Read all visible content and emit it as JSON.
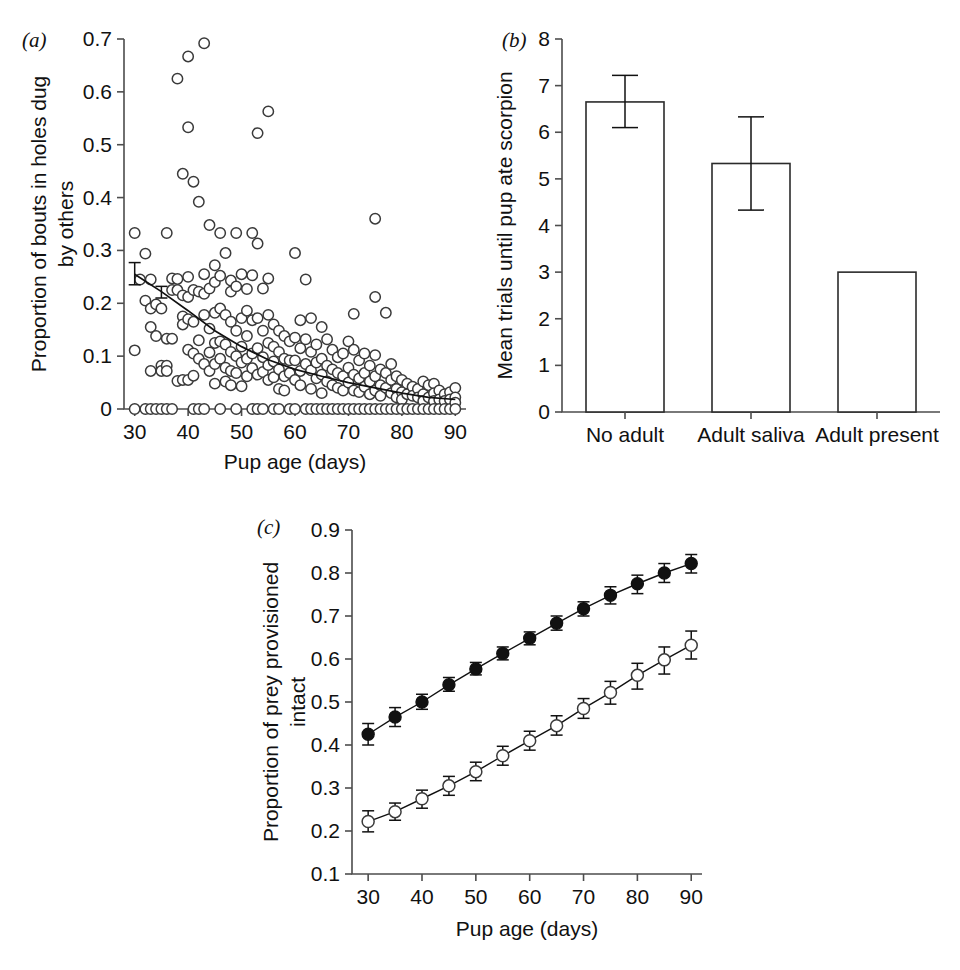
{
  "figure": {
    "background": "#ffffff",
    "axis_color": "#4d4d4d",
    "marker_color": "#111111"
  },
  "panels": {
    "a": {
      "letter": "(a)",
      "xlabel": "Pup age (days)",
      "ylabel_line1": "Proportion of bouts in holes dug",
      "ylabel_line2": "by others",
      "xticks": [
        "30",
        "40",
        "50",
        "60",
        "70",
        "80",
        "90"
      ],
      "yticks": [
        "0",
        "0.1",
        "0.2",
        "0.3",
        "0.4",
        "0.5",
        "0.6",
        "0.7"
      ]
    },
    "b": {
      "letter": "(b)",
      "ylabel": "Mean trials until pup ate scorpion",
      "xticks": [
        "No adult",
        "Adult saliva",
        "Adult present"
      ],
      "yticks": [
        "0",
        "1",
        "2",
        "3",
        "4",
        "5",
        "6",
        "7",
        "8"
      ]
    },
    "c": {
      "letter": "(c)",
      "xlabel": "Pup age (days)",
      "ylabel_line1": "Proportion of prey provisioned",
      "ylabel_line2": "intact",
      "xticks": [
        "30",
        "40",
        "50",
        "60",
        "70",
        "80",
        "90"
      ],
      "yticks": [
        "0.1",
        "0.2",
        "0.3",
        "0.4",
        "0.5",
        "0.6",
        "0.7",
        "0.8",
        "0.9"
      ]
    }
  },
  "chart_data": [
    {
      "id": "panel-a",
      "type": "scatter",
      "title": "",
      "xlabel": "Pup age (days)",
      "ylabel": "Proportion of bouts in holes dug by others",
      "xlim": [
        28,
        92
      ],
      "ylim": [
        0,
        0.7
      ],
      "xticks": [
        30,
        40,
        50,
        60,
        70,
        80,
        90
      ],
      "yticks": [
        0,
        0.1,
        0.2,
        0.3,
        0.4,
        0.5,
        0.6,
        0.7
      ],
      "grid": false,
      "legend": "none",
      "marker": "open-circle",
      "points": [
        [
          30,
          0.333
        ],
        [
          30,
          0.111
        ],
        [
          30,
          0.0
        ],
        [
          31,
          0.245
        ],
        [
          32,
          0.294
        ],
        [
          32,
          0.205
        ],
        [
          32,
          0.0
        ],
        [
          33,
          0.245
        ],
        [
          33,
          0.19
        ],
        [
          33,
          0.155
        ],
        [
          33,
          0.072
        ],
        [
          33,
          0.0
        ],
        [
          34,
          0.198
        ],
        [
          34,
          0.138
        ],
        [
          34,
          0.0
        ],
        [
          35,
          0.19
        ],
        [
          35,
          0.082
        ],
        [
          35,
          0.072
        ],
        [
          35,
          0.0
        ],
        [
          36,
          0.333
        ],
        [
          36,
          0.133
        ],
        [
          36,
          0.082
        ],
        [
          36,
          0.072
        ],
        [
          36,
          0.0
        ],
        [
          37,
          0.247
        ],
        [
          37,
          0.225
        ],
        [
          37,
          0.133
        ],
        [
          37,
          0.0
        ],
        [
          38,
          0.625
        ],
        [
          38,
          0.246
        ],
        [
          38,
          0.225
        ],
        [
          38,
          0.053
        ],
        [
          39,
          0.445
        ],
        [
          39,
          0.215
        ],
        [
          39,
          0.175
        ],
        [
          39,
          0.16
        ],
        [
          39,
          0.055
        ],
        [
          40,
          0.667
        ],
        [
          40,
          0.533
        ],
        [
          40,
          0.25
        ],
        [
          40,
          0.212
        ],
        [
          40,
          0.17
        ],
        [
          40,
          0.112
        ],
        [
          40,
          0.055
        ],
        [
          41,
          0.43
        ],
        [
          41,
          0.225
        ],
        [
          41,
          0.165
        ],
        [
          41,
          0.105
        ],
        [
          41,
          0.063
        ],
        [
          41,
          0.0
        ],
        [
          42,
          0.392
        ],
        [
          42,
          0.222
        ],
        [
          42,
          0.13
        ],
        [
          42,
          0.095
        ],
        [
          42,
          0.0
        ],
        [
          43,
          0.692
        ],
        [
          43,
          0.255
        ],
        [
          43,
          0.218
        ],
        [
          43,
          0.178
        ],
        [
          43,
          0.085
        ],
        [
          43,
          0.0
        ],
        [
          44,
          0.348
        ],
        [
          44,
          0.228
        ],
        [
          44,
          0.152
        ],
        [
          44,
          0.107
        ],
        [
          44,
          0.072
        ],
        [
          45,
          0.272
        ],
        [
          45,
          0.24
        ],
        [
          45,
          0.182
        ],
        [
          45,
          0.125
        ],
        [
          45,
          0.085
        ],
        [
          45,
          0.048
        ],
        [
          46,
          0.333
        ],
        [
          46,
          0.252
        ],
        [
          46,
          0.19
        ],
        [
          46,
          0.128
        ],
        [
          46,
          0.095
        ],
        [
          46,
          0.0
        ],
        [
          47,
          0.295
        ],
        [
          47,
          0.178
        ],
        [
          47,
          0.122
        ],
        [
          47,
          0.078
        ],
        [
          47,
          0.052
        ],
        [
          48,
          0.243
        ],
        [
          48,
          0.222
        ],
        [
          48,
          0.165
        ],
        [
          48,
          0.108
        ],
        [
          48,
          0.072
        ],
        [
          48,
          0.045
        ],
        [
          49,
          0.333
        ],
        [
          49,
          0.232
        ],
        [
          49,
          0.148
        ],
        [
          49,
          0.1
        ],
        [
          49,
          0.068
        ],
        [
          49,
          0.0
        ],
        [
          50,
          0.255
        ],
        [
          50,
          0.172
        ],
        [
          50,
          0.118
        ],
        [
          50,
          0.088
        ],
        [
          50,
          0.043
        ],
        [
          51,
          0.227
        ],
        [
          51,
          0.186
        ],
        [
          51,
          0.138
        ],
        [
          51,
          0.095
        ],
        [
          51,
          0.062
        ],
        [
          52,
          0.333
        ],
        [
          52,
          0.253
        ],
        [
          52,
          0.168
        ],
        [
          52,
          0.105
        ],
        [
          52,
          0.077
        ],
        [
          52,
          0.0
        ],
        [
          53,
          0.522
        ],
        [
          53,
          0.313
        ],
        [
          53,
          0.172
        ],
        [
          53,
          0.115
        ],
        [
          53,
          0.065
        ],
        [
          53,
          0.0
        ],
        [
          54,
          0.228
        ],
        [
          54,
          0.148
        ],
        [
          54,
          0.098
        ],
        [
          54,
          0.07
        ],
        [
          54,
          0.0
        ],
        [
          55,
          0.563
        ],
        [
          55,
          0.247
        ],
        [
          55,
          0.178
        ],
        [
          55,
          0.125
        ],
        [
          55,
          0.083
        ],
        [
          55,
          0.055
        ],
        [
          56,
          0.16
        ],
        [
          56,
          0.118
        ],
        [
          56,
          0.09
        ],
        [
          56,
          0.06
        ],
        [
          56,
          0.0
        ],
        [
          57,
          0.148
        ],
        [
          57,
          0.108
        ],
        [
          57,
          0.075
        ],
        [
          57,
          0.038
        ],
        [
          57,
          0.0
        ],
        [
          58,
          0.138
        ],
        [
          58,
          0.095
        ],
        [
          58,
          0.062
        ],
        [
          58,
          0.035
        ],
        [
          59,
          0.128
        ],
        [
          59,
          0.092
        ],
        [
          59,
          0.068
        ],
        [
          59,
          0.0
        ],
        [
          60,
          0.295
        ],
        [
          60,
          0.135
        ],
        [
          60,
          0.092
        ],
        [
          60,
          0.055
        ],
        [
          60,
          0.0
        ],
        [
          61,
          0.168
        ],
        [
          61,
          0.115
        ],
        [
          61,
          0.072
        ],
        [
          61,
          0.045
        ],
        [
          62,
          0.245
        ],
        [
          62,
          0.132
        ],
        [
          62,
          0.085
        ],
        [
          62,
          0.0
        ],
        [
          63,
          0.172
        ],
        [
          63,
          0.108
        ],
        [
          63,
          0.073
        ],
        [
          63,
          0.038
        ],
        [
          63,
          0.0
        ],
        [
          64,
          0.122
        ],
        [
          64,
          0.088
        ],
        [
          64,
          0.058
        ],
        [
          64,
          0.0
        ],
        [
          65,
          0.155
        ],
        [
          65,
          0.095
        ],
        [
          65,
          0.065
        ],
        [
          65,
          0.03
        ],
        [
          65,
          0.0
        ],
        [
          66,
          0.132
        ],
        [
          66,
          0.082
        ],
        [
          66,
          0.052
        ],
        [
          66,
          0.0
        ],
        [
          67,
          0.112
        ],
        [
          67,
          0.075
        ],
        [
          67,
          0.045
        ],
        [
          67,
          0.0
        ],
        [
          68,
          0.098
        ],
        [
          68,
          0.068
        ],
        [
          68,
          0.04
        ],
        [
          68,
          0.0
        ],
        [
          69,
          0.105
        ],
        [
          69,
          0.062
        ],
        [
          69,
          0.035
        ],
        [
          69,
          0.0
        ],
        [
          70,
          0.128
        ],
        [
          70,
          0.078
        ],
        [
          70,
          0.05
        ],
        [
          70,
          0.0
        ],
        [
          71,
          0.18
        ],
        [
          71,
          0.112
        ],
        [
          71,
          0.065
        ],
        [
          71,
          0.035
        ],
        [
          71,
          0.0
        ],
        [
          72,
          0.092
        ],
        [
          72,
          0.058
        ],
        [
          72,
          0.032
        ],
        [
          72,
          0.0
        ],
        [
          73,
          0.105
        ],
        [
          73,
          0.068
        ],
        [
          73,
          0.042
        ],
        [
          73,
          0.0
        ],
        [
          74,
          0.082
        ],
        [
          74,
          0.052
        ],
        [
          74,
          0.028
        ],
        [
          74,
          0.0
        ],
        [
          75,
          0.36
        ],
        [
          75,
          0.212
        ],
        [
          75,
          0.102
        ],
        [
          75,
          0.062
        ],
        [
          75,
          0.035
        ],
        [
          75,
          0.0
        ],
        [
          76,
          0.075
        ],
        [
          76,
          0.045
        ],
        [
          76,
          0.025
        ],
        [
          76,
          0.0
        ],
        [
          77,
          0.182
        ],
        [
          77,
          0.068
        ],
        [
          77,
          0.04
        ],
        [
          77,
          0.0
        ],
        [
          78,
          0.085
        ],
        [
          78,
          0.055
        ],
        [
          78,
          0.03
        ],
        [
          78,
          0.0
        ],
        [
          79,
          0.062
        ],
        [
          79,
          0.038
        ],
        [
          79,
          0.022
        ],
        [
          79,
          0.0
        ],
        [
          80,
          0.055
        ],
        [
          80,
          0.032
        ],
        [
          80,
          0.018
        ],
        [
          80,
          0.0
        ],
        [
          81,
          0.048
        ],
        [
          81,
          0.028
        ],
        [
          81,
          0.0
        ],
        [
          82,
          0.042
        ],
        [
          82,
          0.025
        ],
        [
          82,
          0.0
        ],
        [
          83,
          0.038
        ],
        [
          83,
          0.022
        ],
        [
          83,
          0.0
        ],
        [
          84,
          0.052
        ],
        [
          84,
          0.028
        ],
        [
          84,
          0.015
        ],
        [
          84,
          0.0
        ],
        [
          85,
          0.045
        ],
        [
          85,
          0.022
        ],
        [
          85,
          0.0
        ],
        [
          86,
          0.048
        ],
        [
          86,
          0.03
        ],
        [
          86,
          0.015
        ],
        [
          86,
          0.0
        ],
        [
          87,
          0.035
        ],
        [
          87,
          0.018
        ],
        [
          87,
          0.0
        ],
        [
          88,
          0.028
        ],
        [
          88,
          0.015
        ],
        [
          88,
          0.0
        ],
        [
          89,
          0.032
        ],
        [
          89,
          0.018
        ],
        [
          89,
          0.0
        ],
        [
          90,
          0.04
        ],
        [
          90,
          0.022
        ],
        [
          90,
          0.012
        ],
        [
          90,
          0.0
        ]
      ],
      "fit_line": [
        [
          30,
          0.255
        ],
        [
          35,
          0.222
        ],
        [
          40,
          0.186
        ],
        [
          45,
          0.148
        ],
        [
          50,
          0.118
        ],
        [
          55,
          0.093
        ],
        [
          60,
          0.075
        ],
        [
          65,
          0.062
        ],
        [
          70,
          0.05
        ],
        [
          75,
          0.04
        ],
        [
          80,
          0.03
        ],
        [
          85,
          0.022
        ],
        [
          90,
          0.018
        ]
      ],
      "fit_errorbars": [
        {
          "x": 30,
          "y": 0.255,
          "low": 0.235,
          "high": 0.277
        },
        {
          "x": 35,
          "y": 0.222,
          "low": 0.21,
          "high": 0.232
        }
      ]
    },
    {
      "id": "panel-b",
      "type": "bar",
      "title": "",
      "xlabel": "",
      "ylabel": "Mean trials until pup ate scorpion",
      "categories": [
        "No adult",
        "Adult saliva",
        "Adult present"
      ],
      "values": [
        6.65,
        5.33,
        3.0
      ],
      "errors_low": [
        6.1,
        4.33,
        null
      ],
      "errors_high": [
        7.22,
        6.33,
        null
      ],
      "ylim": [
        0,
        8
      ],
      "yticks": [
        0,
        1,
        2,
        3,
        4,
        5,
        6,
        7,
        8
      ],
      "grid": false,
      "legend": "none"
    },
    {
      "id": "panel-c",
      "type": "line",
      "title": "",
      "xlabel": "Pup age (days)",
      "ylabel": "Proportion of prey provisioned intact",
      "x": [
        30,
        35,
        40,
        45,
        50,
        55,
        60,
        65,
        70,
        75,
        80,
        85,
        90
      ],
      "xlim": [
        27,
        92
      ],
      "ylim": [
        0.1,
        0.9
      ],
      "xticks": [
        30,
        40,
        50,
        60,
        70,
        80,
        90
      ],
      "yticks": [
        0.1,
        0.2,
        0.3,
        0.4,
        0.5,
        0.6,
        0.7,
        0.8,
        0.9
      ],
      "grid": false,
      "legend": "none",
      "series": [
        {
          "name": "filled-circles",
          "marker": "filled-circle",
          "values": [
            0.425,
            0.465,
            0.5,
            0.54,
            0.577,
            0.613,
            0.648,
            0.683,
            0.717,
            0.748,
            0.775,
            0.8,
            0.822
          ],
          "err_low": [
            0.4,
            0.443,
            0.483,
            0.525,
            0.563,
            0.598,
            0.633,
            0.667,
            0.7,
            0.728,
            0.752,
            0.778,
            0.8
          ],
          "err_high": [
            0.45,
            0.487,
            0.518,
            0.557,
            0.592,
            0.628,
            0.663,
            0.7,
            0.733,
            0.768,
            0.795,
            0.822,
            0.843
          ]
        },
        {
          "name": "open-circles",
          "marker": "open-circle",
          "values": [
            0.222,
            0.245,
            0.275,
            0.305,
            0.338,
            0.375,
            0.41,
            0.445,
            0.485,
            0.522,
            0.562,
            0.598,
            0.632
          ],
          "err_low": [
            0.198,
            0.225,
            0.253,
            0.283,
            0.317,
            0.353,
            0.388,
            0.423,
            0.462,
            0.495,
            0.53,
            0.565,
            0.6
          ],
          "err_high": [
            0.247,
            0.265,
            0.295,
            0.327,
            0.36,
            0.397,
            0.432,
            0.468,
            0.508,
            0.548,
            0.59,
            0.628,
            0.665
          ]
        }
      ]
    }
  ]
}
